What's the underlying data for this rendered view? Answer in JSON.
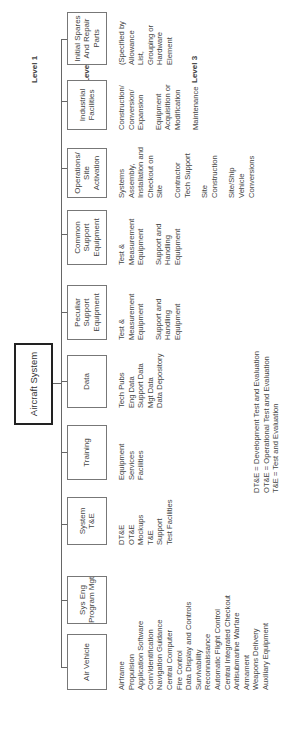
{
  "levels": {
    "l1": "Level 1",
    "l2": "Level 2",
    "l3": "Level 3"
  },
  "root": "Aircraft System",
  "level2": [
    {
      "label": "Air Vehicle"
    },
    {
      "label": "Sys Eng\nProgram Mgt"
    },
    {
      "label": "System\nT&E"
    },
    {
      "label": "Training"
    },
    {
      "label": "Data"
    },
    {
      "label": "Peculiar\nSupport\nEquipment"
    },
    {
      "label": "Common\nSupport\nEquipment"
    },
    {
      "label": "Operations/\nSite\nActivation"
    },
    {
      "label": "Industrial\nFacilities"
    },
    {
      "label": "Initial Spares\nAnd Repair\nParts"
    }
  ],
  "level3": {
    "air_vehicle": [
      "Airframe",
      "Propulsion",
      "Application Software",
      "Com/Identification",
      "Navigation Guidance",
      "Central Computer",
      "Fire Control",
      "Data Display and Controls",
      "Survivability",
      "Reconnaissance",
      "Automatic Flight Control",
      "Central Integrated Checkout",
      "Antisubmarine Warfare",
      "Armament",
      "Weapons Delivery",
      "Auxiliary Equipment"
    ],
    "system_te": [
      "DT&E",
      "OT&E",
      "Mockups",
      "T&E",
      "Support",
      "Test Facilities"
    ],
    "training": [
      "Equipment",
      "Services",
      "Facilities"
    ],
    "data": [
      "Tech Pubs",
      "Eng Data",
      "Support Data",
      "Mgt Data",
      "Data Depository"
    ],
    "peculiar_support": [
      [
        "Test &",
        "Measurement",
        "Equipment"
      ],
      [
        "Support and",
        "Handling",
        "Equipment"
      ]
    ],
    "common_support": [
      [
        "Test &",
        "Measurement",
        "Equipment"
      ],
      [
        "Support and",
        "Handling",
        "Equipment"
      ]
    ],
    "operations": [
      [
        "Systems",
        "Assembly,",
        "Installation and",
        "Checkout on",
        "Site"
      ],
      [
        "Contractor",
        "Tech Support"
      ],
      [
        "Site",
        "Construction"
      ],
      [
        "Site/Ship",
        "Vehicle",
        "Conversions"
      ]
    ],
    "industrial": [
      [
        "Construction/",
        "Conversion/",
        "Expansion"
      ],
      [
        "Equipment",
        "Acquisition or",
        "Modification"
      ],
      [
        "Maintenance"
      ]
    ],
    "spares": [
      "(Specified by",
      "Allowance",
      "List,",
      "Grouping or",
      "Hardware",
      "Element"
    ]
  },
  "legend": [
    "DT&E = Development Test and Evaluation",
    "OT&E = Operational Test and Evaluation",
    "T&E = Test and Evaluation"
  ]
}
